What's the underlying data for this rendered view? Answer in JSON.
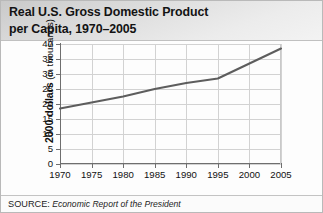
{
  "figure": {
    "title_line1": "Real U.S. Gross Domestic Product",
    "title_line2": "per Capita, 1970–2005",
    "title_full": "Real U.S. Gross Domestic Product per Capita, 1970–2005",
    "source_kicker": "SOURCE:",
    "source_text": "Economic Report of the President",
    "colors": {
      "title_band_dark": "#c9c9c9",
      "title_band_light": "#f3f3f3",
      "series_line": "#5d5d5d",
      "gridline": "#d2d2d2",
      "axis": "#6e6e6e",
      "text": "#111111",
      "plot_background": "#ffffff",
      "figure_border": "#b9b9b9"
    }
  },
  "chart_data": {
    "type": "line",
    "title": "Real U.S. Gross Domestic Product per Capita, 1970–2005",
    "xlabel": "",
    "ylabel": "2000 dollars (in thousands)",
    "ylabel_strong": "2000 dollars",
    "ylabel_thin": " (in thousands)",
    "x": [
      1970,
      1975,
      1980,
      1985,
      1990,
      1995,
      2000,
      2005
    ],
    "values": [
      18.5,
      20.5,
      22.5,
      25.0,
      27.0,
      28.5,
      33.5,
      38.5
    ],
    "series": [
      {
        "name": "Real GDP per capita",
        "values": [
          18.5,
          20.5,
          22.5,
          25.0,
          27.0,
          28.5,
          33.5,
          38.5
        ]
      }
    ],
    "xlim": [
      1970,
      2005
    ],
    "ylim": [
      0,
      40
    ],
    "xticks": [
      1970,
      1975,
      1980,
      1985,
      1990,
      1995,
      2000,
      2005
    ],
    "xtick_labels": [
      "1970",
      "1975",
      "1980",
      "1985",
      "1990",
      "1995",
      "2000",
      "2005"
    ],
    "yticks": [
      0,
      5,
      10,
      15,
      20,
      25,
      30,
      35,
      40
    ],
    "ytick_labels": [
      "0",
      "5",
      "10",
      "15",
      "20",
      "25",
      "30",
      "35",
      "40"
    ],
    "grid": true,
    "grid_axis": "both",
    "legend": false,
    "legend_position": "none",
    "units": "thousands of constant 2000 dollars",
    "annotations": []
  }
}
